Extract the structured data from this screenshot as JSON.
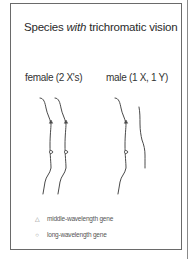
{
  "title": {
    "prefix": "Species ",
    "emphasis": "with",
    "suffix": " trichromatic vision"
  },
  "groups": [
    {
      "label": "female (2 X's)",
      "chromosomes": [
        {
          "type": "X",
          "genes": [
            "middle-wavelength",
            "long-wavelength"
          ]
        },
        {
          "type": "X",
          "genes": [
            "middle-wavelength",
            "long-wavelength"
          ]
        }
      ]
    },
    {
      "label": "male (1 X, 1 Y)",
      "chromosomes": [
        {
          "type": "X",
          "genes": [
            "middle-wavelength",
            "long-wavelength"
          ]
        },
        {
          "type": "Y",
          "genes": []
        }
      ]
    }
  ],
  "legend": [
    {
      "symbol": "△",
      "icon": "triangle-icon",
      "label": "middle-wavelength gene"
    },
    {
      "symbol": "○",
      "icon": "circle-icon",
      "label": "long-wavelength gene"
    }
  ],
  "colors": {
    "line": "#4a4a4a",
    "frame": "#6a6a6a",
    "text": "#2a2a2a"
  }
}
